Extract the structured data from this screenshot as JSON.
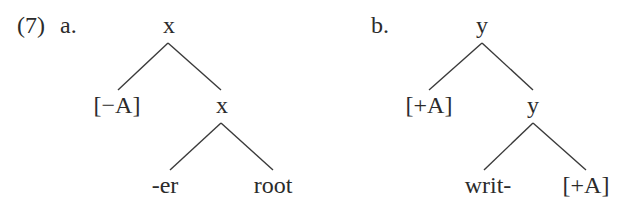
{
  "example": {
    "number": "(7)",
    "trees": [
      {
        "label": "a.",
        "root": "x",
        "left_child": "[−A]",
        "right_child": "x",
        "right_left_leaf": "-er",
        "right_right_leaf": "root"
      },
      {
        "label": "b.",
        "root": "y",
        "left_child": "[+A]",
        "right_child": "y",
        "right_left_leaf": "writ-",
        "right_right_leaf": "[+A]"
      }
    ]
  }
}
